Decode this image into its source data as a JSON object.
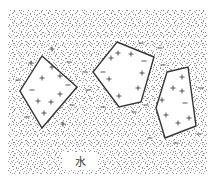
{
  "diagram": {
    "colors": {
      "background": "#ffffff",
      "stipple": "#8a8a8a",
      "outline": "#333333",
      "charge": "#444444"
    },
    "water": {
      "label": "水",
      "region": {
        "x": 8,
        "y": 10,
        "width": 199,
        "height": 165
      },
      "external_charges": [
        {
          "sign": "+",
          "x": 31,
          "y": 63
        },
        {
          "sign": "−",
          "x": 18,
          "y": 80
        },
        {
          "sign": "−",
          "x": 69,
          "y": 62
        },
        {
          "sign": "+",
          "x": 52,
          "y": 49
        },
        {
          "sign": "−",
          "x": 85,
          "y": 72
        },
        {
          "sign": "−",
          "x": 88,
          "y": 90
        },
        {
          "sign": "−",
          "x": 72,
          "y": 105
        },
        {
          "sign": "+",
          "x": 63,
          "y": 124
        },
        {
          "sign": "−",
          "x": 27,
          "y": 117
        },
        {
          "sign": "−",
          "x": 103,
          "y": 107
        },
        {
          "sign": "−",
          "x": 134,
          "y": 112
        },
        {
          "sign": "−",
          "x": 146,
          "y": 105
        },
        {
          "sign": "−",
          "x": 141,
          "y": 43
        },
        {
          "sign": "−",
          "x": 163,
          "y": 65
        },
        {
          "sign": "−",
          "x": 160,
          "y": 48
        },
        {
          "sign": "−",
          "x": 201,
          "y": 88
        },
        {
          "sign": "−",
          "x": 199,
          "y": 134
        },
        {
          "sign": "−",
          "x": 176,
          "y": 143
        },
        {
          "sign": "−",
          "x": 150,
          "y": 138
        }
      ]
    },
    "particles": [
      {
        "name": "particle-1",
        "points": "42,56 77,87 42,128 20,91",
        "charges": [
          {
            "sign": "+",
            "x": 52,
            "y": 67
          },
          {
            "sign": "+",
            "x": 42,
            "y": 78
          },
          {
            "sign": "+",
            "x": 60,
            "y": 76
          },
          {
            "sign": "−",
            "x": 68,
            "y": 85
          },
          {
            "sign": "−",
            "x": 32,
            "y": 90
          },
          {
            "sign": "+",
            "x": 60,
            "y": 94
          },
          {
            "sign": "+",
            "x": 38,
            "y": 101
          },
          {
            "sign": "+",
            "x": 51,
            "y": 102
          },
          {
            "sign": "+",
            "x": 44,
            "y": 113
          }
        ]
      },
      {
        "name": "particle-2",
        "points": "117,42 154,57 141,102 119,107 93,72",
        "charges": [
          {
            "sign": "+",
            "x": 111,
            "y": 58
          },
          {
            "sign": "+",
            "x": 118,
            "y": 53
          },
          {
            "sign": "+",
            "x": 131,
            "y": 54
          },
          {
            "sign": "−",
            "x": 144,
            "y": 61
          },
          {
            "sign": "−",
            "x": 103,
            "y": 72
          },
          {
            "sign": "+",
            "x": 142,
            "y": 73
          },
          {
            "sign": "+",
            "x": 109,
            "y": 79
          },
          {
            "sign": "+",
            "x": 138,
            "y": 88
          },
          {
            "sign": "+",
            "x": 119,
            "y": 96
          }
        ]
      },
      {
        "name": "particle-3",
        "points": "167,72 188,67 196,126 165,138 156,108",
        "charges": [
          {
            "sign": "+",
            "x": 182,
            "y": 77
          },
          {
            "sign": "+",
            "x": 173,
            "y": 88
          },
          {
            "sign": "+",
            "x": 182,
            "y": 91
          },
          {
            "sign": "+",
            "x": 162,
            "y": 100
          },
          {
            "sign": "−",
            "x": 185,
            "y": 103
          },
          {
            "sign": "+",
            "x": 166,
            "y": 115
          },
          {
            "sign": "+",
            "x": 178,
            "y": 123
          },
          {
            "sign": "+",
            "x": 189,
            "y": 118
          }
        ]
      }
    ]
  }
}
